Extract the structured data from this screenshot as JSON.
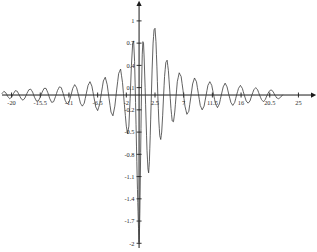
{
  "chart_data": {
    "type": "line",
    "title": "",
    "subtitle": "",
    "xlabel": "",
    "ylabel": "",
    "grid": false,
    "legend": false,
    "xlim": [
      -21.5,
      26.5
    ],
    "ylim": [
      -2.05,
      1.12
    ],
    "x_ticks": [
      -20,
      -15.5,
      -11,
      -6.5,
      -2,
      2.5,
      7,
      11.5,
      16,
      20.5,
      25
    ],
    "x_tick_labels": [
      "-20",
      "-15.5",
      "-11",
      "-6.5",
      "-2",
      "2.5",
      "7",
      "11.5",
      "16",
      "20.5",
      "25"
    ],
    "y_ticks": [
      1,
      0.7,
      0.4,
      0.1,
      -0.2,
      -0.5,
      -0.8,
      -1.1,
      -1.4,
      -1.7,
      -2
    ],
    "y_tick_labels": [
      "1",
      "0.7",
      "0.4",
      "0.1",
      "-0.2",
      "-0.5",
      "-0.8",
      "-1.1",
      "-1.4",
      "-1.7",
      "-2"
    ],
    "axis_arrows": [
      "x-right",
      "y-up"
    ],
    "series": [
      {
        "name": "damped oscillation",
        "color": "#3a3a3a",
        "description": "Rapidly oscillating decaying wave with a deep negative spike reaching -2 just right of the origin and a tall positive lobe near x = 1; ripple amplitude decays toward +/-20.",
        "points": [
          [
            -21.5,
            0.02
          ],
          [
            -21.2,
            0.05
          ],
          [
            -20.9,
            0.03
          ],
          [
            -20.6,
            -0.02
          ],
          [
            -20.3,
            -0.05
          ],
          [
            -20.0,
            -0.03
          ],
          [
            -19.7,
            0.02
          ],
          [
            -19.4,
            0.06
          ],
          [
            -19.1,
            0.05
          ],
          [
            -18.8,
            0.0
          ],
          [
            -18.5,
            -0.05
          ],
          [
            -18.2,
            -0.07
          ],
          [
            -17.9,
            -0.04
          ],
          [
            -17.6,
            0.02
          ],
          [
            -17.3,
            0.07
          ],
          [
            -17.0,
            0.08
          ],
          [
            -16.7,
            0.04
          ],
          [
            -16.4,
            -0.03
          ],
          [
            -16.1,
            -0.08
          ],
          [
            -15.8,
            -0.08
          ],
          [
            -15.5,
            -0.03
          ],
          [
            -15.2,
            0.04
          ],
          [
            -14.9,
            0.09
          ],
          [
            -14.6,
            0.09
          ],
          [
            -14.3,
            0.03
          ],
          [
            -14.0,
            -0.05
          ],
          [
            -13.7,
            -0.1
          ],
          [
            -13.4,
            -0.09
          ],
          [
            -13.1,
            -0.02
          ],
          [
            -12.8,
            0.06
          ],
          [
            -12.5,
            0.11
          ],
          [
            -12.2,
            0.1
          ],
          [
            -11.9,
            0.02
          ],
          [
            -11.6,
            -0.07
          ],
          [
            -11.3,
            -0.12
          ],
          [
            -11.0,
            -0.1
          ],
          [
            -10.7,
            -0.01
          ],
          [
            -10.4,
            0.09
          ],
          [
            -10.1,
            0.14
          ],
          [
            -9.8,
            0.1
          ],
          [
            -9.5,
            0.0
          ],
          [
            -9.2,
            -0.11
          ],
          [
            -8.9,
            -0.15
          ],
          [
            -8.6,
            -0.11
          ],
          [
            -8.3,
            0.01
          ],
          [
            -8.0,
            0.13
          ],
          [
            -7.7,
            0.18
          ],
          [
            -7.4,
            0.12
          ],
          [
            -7.1,
            -0.02
          ],
          [
            -6.8,
            -0.16
          ],
          [
            -6.5,
            -0.21
          ],
          [
            -6.2,
            -0.13
          ],
          [
            -5.9,
            0.03
          ],
          [
            -5.6,
            0.19
          ],
          [
            -5.3,
            0.24
          ],
          [
            -5.0,
            0.14
          ],
          [
            -4.7,
            -0.05
          ],
          [
            -4.4,
            -0.23
          ],
          [
            -4.1,
            -0.28
          ],
          [
            -3.8,
            -0.15
          ],
          [
            -3.5,
            0.08
          ],
          [
            -3.2,
            0.29
          ],
          [
            -2.9,
            0.35
          ],
          [
            -2.6,
            0.17
          ],
          [
            -2.3,
            -0.13
          ],
          [
            -2.0,
            -0.42
          ],
          [
            -1.8,
            -0.52
          ],
          [
            -1.6,
            -0.42
          ],
          [
            -1.4,
            -0.05
          ],
          [
            -1.2,
            0.4
          ],
          [
            -1.0,
            0.7
          ],
          [
            -0.85,
            0.73
          ],
          [
            -0.7,
            0.45
          ],
          [
            -0.55,
            -0.1
          ],
          [
            -0.4,
            -0.7
          ],
          [
            -0.3,
            -1.1
          ],
          [
            -0.2,
            -1.45
          ],
          [
            -0.12,
            -1.7
          ],
          [
            -0.05,
            -1.9
          ],
          [
            0.0,
            -1.99
          ],
          [
            0.05,
            -1.9
          ],
          [
            0.12,
            -1.6
          ],
          [
            0.2,
            -1.1
          ],
          [
            0.3,
            -0.45
          ],
          [
            0.4,
            0.15
          ],
          [
            0.5,
            0.55
          ],
          [
            0.6,
            0.72
          ],
          [
            0.7,
            0.7
          ],
          [
            0.8,
            0.5
          ],
          [
            0.95,
            0.1
          ],
          [
            1.1,
            -0.35
          ],
          [
            1.25,
            -0.75
          ],
          [
            1.4,
            -1.0
          ],
          [
            1.5,
            -1.05
          ],
          [
            1.62,
            -0.9
          ],
          [
            1.75,
            -0.55
          ],
          [
            1.9,
            -0.1
          ],
          [
            2.05,
            0.35
          ],
          [
            2.2,
            0.7
          ],
          [
            2.35,
            0.88
          ],
          [
            2.5,
            0.9
          ],
          [
            2.65,
            0.72
          ],
          [
            2.8,
            0.38
          ],
          [
            2.95,
            -0.02
          ],
          [
            3.1,
            -0.35
          ],
          [
            3.25,
            -0.55
          ],
          [
            3.4,
            -0.6
          ],
          [
            3.55,
            -0.5
          ],
          [
            3.7,
            -0.28
          ],
          [
            3.85,
            0.0
          ],
          [
            4.0,
            0.25
          ],
          [
            4.2,
            0.44
          ],
          [
            4.4,
            0.47
          ],
          [
            4.6,
            0.33
          ],
          [
            4.8,
            0.08
          ],
          [
            5.0,
            -0.18
          ],
          [
            5.2,
            -0.35
          ],
          [
            5.4,
            -0.36
          ],
          [
            5.6,
            -0.23
          ],
          [
            5.8,
            -0.02
          ],
          [
            6.0,
            0.18
          ],
          [
            6.3,
            0.3
          ],
          [
            6.6,
            0.25
          ],
          [
            6.9,
            0.06
          ],
          [
            7.2,
            -0.15
          ],
          [
            7.5,
            -0.26
          ],
          [
            7.8,
            -0.22
          ],
          [
            8.1,
            -0.04
          ],
          [
            8.4,
            0.15
          ],
          [
            8.7,
            0.23
          ],
          [
            9.0,
            0.18
          ],
          [
            9.3,
            0.02
          ],
          [
            9.6,
            -0.14
          ],
          [
            9.9,
            -0.2
          ],
          [
            10.2,
            -0.15
          ],
          [
            10.5,
            -0.01
          ],
          [
            10.8,
            0.13
          ],
          [
            11.1,
            0.18
          ],
          [
            11.4,
            0.13
          ],
          [
            11.7,
            0.0
          ],
          [
            12.0,
            -0.12
          ],
          [
            12.3,
            -0.17
          ],
          [
            12.6,
            -0.12
          ],
          [
            12.9,
            0.0
          ],
          [
            13.2,
            0.11
          ],
          [
            13.5,
            0.16
          ],
          [
            13.8,
            0.11
          ],
          [
            14.1,
            0.0
          ],
          [
            14.4,
            -0.1
          ],
          [
            14.7,
            -0.14
          ],
          [
            15.0,
            -0.1
          ],
          [
            15.3,
            0.0
          ],
          [
            15.6,
            0.09
          ],
          [
            15.9,
            0.13
          ],
          [
            16.2,
            0.09
          ],
          [
            16.5,
            0.0
          ],
          [
            16.8,
            -0.08
          ],
          [
            17.1,
            -0.11
          ],
          [
            17.4,
            -0.08
          ],
          [
            17.7,
            0.0
          ],
          [
            18.0,
            0.07
          ],
          [
            18.3,
            0.1
          ],
          [
            18.6,
            0.07
          ],
          [
            18.9,
            0.0
          ],
          [
            19.2,
            -0.06
          ],
          [
            19.5,
            -0.09
          ],
          [
            19.8,
            -0.06
          ],
          [
            20.1,
            0.0
          ],
          [
            20.4,
            0.05
          ],
          [
            20.7,
            0.07
          ],
          [
            21.0,
            0.05
          ],
          [
            21.3,
            0.0
          ],
          [
            21.6,
            -0.04
          ],
          [
            21.9,
            -0.05
          ],
          [
            22.2,
            -0.03
          ],
          [
            22.5,
            0.0
          ]
        ]
      }
    ]
  }
}
